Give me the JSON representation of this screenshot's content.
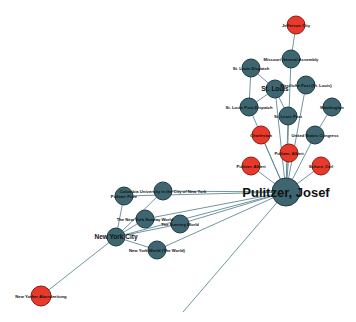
{
  "graph": {
    "title": "Pulitzer, Josef network",
    "colors": {
      "person_or_place": "#3d6670",
      "highlight": "#e8392b",
      "edge": "#5f8a94",
      "background": "#ffffff"
    },
    "nodes": [
      {
        "id": "pulitzer",
        "label": "Pulitzer, Josef",
        "x": 286,
        "y": 192,
        "r": 14,
        "color": "blue",
        "size": "lg"
      },
      {
        "id": "jefferson",
        "label": "Jefferson City",
        "x": 296,
        "y": 25,
        "r": 9,
        "color": "red",
        "size": "sm"
      },
      {
        "id": "missouri",
        "label": "Missouri General Assembly",
        "x": 291,
        "y": 59,
        "r": 9,
        "color": "blue",
        "size": "sm"
      },
      {
        "id": "stlouis_dispatch",
        "label": "St. Louis Dispatch",
        "x": 251,
        "y": 68,
        "r": 9,
        "color": "blue",
        "size": "sm"
      },
      {
        "id": "stlouis",
        "label": "St. Louis",
        "x": 275,
        "y": 89,
        "r": 9,
        "color": "blue",
        "size": "md"
      },
      {
        "id": "westliche_post",
        "label": "Westliche Post (St. Louis)",
        "x": 306,
        "y": 85,
        "r": 9,
        "color": "blue",
        "size": "sm"
      },
      {
        "id": "stlouis_post_dispatch",
        "label": "St. Louis Post-Dispatch",
        "x": 249,
        "y": 107,
        "r": 9,
        "color": "blue",
        "size": "sm"
      },
      {
        "id": "stlouis_post",
        "label": "St. Louis Post",
        "x": 288,
        "y": 116,
        "r": 9,
        "color": "blue",
        "size": "sm"
      },
      {
        "id": "washington",
        "label": "Washington",
        "x": 332,
        "y": 107,
        "r": 9,
        "color": "blue",
        "size": "sm"
      },
      {
        "id": "charleston",
        "label": "Charleston",
        "x": 261,
        "y": 135,
        "r": 9,
        "color": "red",
        "size": "sm"
      },
      {
        "id": "us_congress",
        "label": "United States Congress",
        "x": 315,
        "y": 135,
        "r": 9,
        "color": "blue",
        "size": "sm"
      },
      {
        "id": "pulitzer_albert_top",
        "label": "Pulitzer, Albert",
        "x": 289,
        "y": 153,
        "r": 9,
        "color": "red",
        "size": "sm"
      },
      {
        "id": "pulitzer_albert",
        "label": "Pulitzer, Albert",
        "x": 251,
        "y": 166,
        "r": 9,
        "color": "red",
        "size": "sm"
      },
      {
        "id": "schurz_carl",
        "label": "Schurz, Carl",
        "x": 321,
        "y": 166,
        "r": 9,
        "color": "red",
        "size": "sm"
      },
      {
        "id": "columbia",
        "label": "Columbia University in the City of New York",
        "x": 163,
        "y": 191,
        "r": 9,
        "color": "blue",
        "size": "sm"
      },
      {
        "id": "pulitzer_prize",
        "label": "Pulitzer Prize",
        "x": 124,
        "y": 196,
        "r": 9,
        "color": "blue",
        "size": "sm"
      },
      {
        "id": "ny_sunday_world",
        "label": "The New York Sunday World",
        "x": 145,
        "y": 219,
        "r": 9,
        "color": "blue",
        "size": "sm"
      },
      {
        "id": "evening_world",
        "label": "The Evening World",
        "x": 180,
        "y": 224,
        "r": 9,
        "color": "blue",
        "size": "sm"
      },
      {
        "id": "nyc",
        "label": "New York City",
        "x": 116,
        "y": 237,
        "r": 9,
        "color": "blue",
        "size": "md"
      },
      {
        "id": "ny_world",
        "label": "New York World (The World)",
        "x": 157,
        "y": 250,
        "r": 9,
        "color": "blue",
        "size": "sm"
      },
      {
        "id": "ny_abendzeitung",
        "label": "New Yorker Abendzeitung",
        "x": 41,
        "y": 296,
        "r": 10,
        "color": "red",
        "size": "sm"
      }
    ],
    "edges": [
      [
        "jefferson",
        "missouri"
      ],
      [
        "missouri",
        "pulitzer"
      ],
      [
        "stlouis_dispatch",
        "stlouis"
      ],
      [
        "stlouis_dispatch",
        "stlouis_post_dispatch"
      ],
      [
        "stlouis",
        "pulitzer"
      ],
      [
        "stlouis",
        "stlouis_post"
      ],
      [
        "stlouis",
        "stlouis_post_dispatch"
      ],
      [
        "westliche_post",
        "pulitzer"
      ],
      [
        "stlouis_post_dispatch",
        "pulitzer"
      ],
      [
        "stlouis_post",
        "pulitzer"
      ],
      [
        "washington",
        "us_congress"
      ],
      [
        "us_congress",
        "pulitzer"
      ],
      [
        "charleston",
        "pulitzer"
      ],
      [
        "pulitzer_albert_top",
        "pulitzer"
      ],
      [
        "pulitzer_albert",
        "pulitzer"
      ],
      [
        "schurz_carl",
        "pulitzer"
      ],
      [
        "columbia",
        "pulitzer"
      ],
      [
        "pulitzer_prize",
        "pulitzer"
      ],
      [
        "pulitzer_prize",
        "nyc"
      ],
      [
        "ny_sunday_world",
        "pulitzer"
      ],
      [
        "ny_sunday_world",
        "nyc"
      ],
      [
        "evening_world",
        "pulitzer"
      ],
      [
        "evening_world",
        "nyc"
      ],
      [
        "nyc",
        "pulitzer"
      ],
      [
        "nyc",
        "ny_world"
      ],
      [
        "ny_world",
        "pulitzer"
      ],
      [
        "nyc",
        "ny_abendzeitung"
      ],
      [
        "columbia",
        "nyc"
      ]
    ],
    "dangling_edges": [
      {
        "from": "pulitzer",
        "x2": 183,
        "y2": 312
      }
    ]
  }
}
